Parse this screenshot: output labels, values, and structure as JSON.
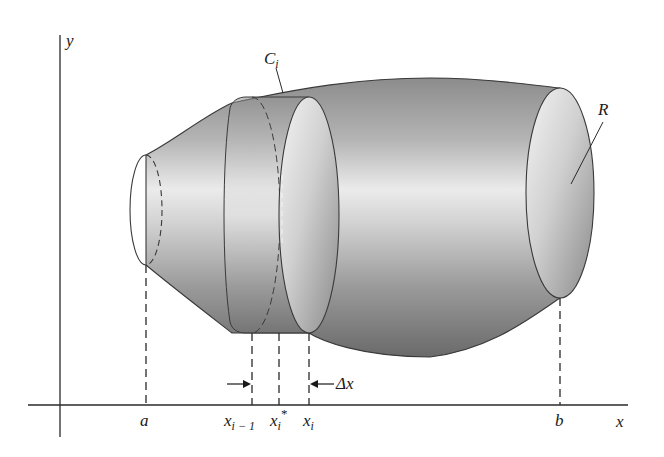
{
  "figure": {
    "type": "solid-of-revolution-diagram",
    "axes": {
      "x_label": "x",
      "y_label": "y"
    },
    "solid_label": "R",
    "slice_label": "C",
    "slice_label_sub": "i",
    "ticks": {
      "a": "a",
      "b": "b",
      "x_prev": "x",
      "x_prev_sub": "i − 1",
      "x_star": "x",
      "x_star_sub": "i",
      "x_star_sup": "*",
      "x_i": "x",
      "x_i_sub": "i"
    },
    "width_label": "Δx",
    "colors": {
      "line": "#2a2a2a",
      "surface_dark": "#6e6e6e",
      "surface_mid": "#a9a9a9",
      "surface_light": "#ececec",
      "background": "#ffffff"
    }
  }
}
